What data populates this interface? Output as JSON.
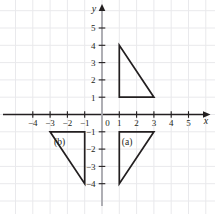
{
  "chart_data": {
    "type": "scatter",
    "title": "",
    "xlabel": "x",
    "ylabel": "y",
    "grid": true,
    "grid_spacing": 1,
    "legend": "none",
    "xlim": [
      -5,
      6
    ],
    "ylim": [
      -5,
      6
    ],
    "x_ticks": [
      -4,
      -3,
      -2,
      -1,
      0,
      1,
      2,
      3,
      4,
      5
    ],
    "y_ticks": [
      5,
      4,
      3,
      2,
      1,
      0,
      -1,
      -2,
      -3,
      -4
    ],
    "x_tick_labels": [
      "−4",
      "−3",
      "−2",
      "−1",
      "0",
      "1",
      "2",
      "3",
      "4",
      "5"
    ],
    "y_tick_labels": [
      "5",
      "4",
      "3",
      "2",
      "1",
      "0",
      "−1",
      "−2",
      "−3",
      "−4"
    ],
    "origin_label": "0",
    "series": [
      {
        "name": "original-triangle",
        "label": "",
        "type": "polygon",
        "vertices": [
          [
            1,
            4
          ],
          [
            1,
            1
          ],
          [
            3,
            1
          ]
        ],
        "color": "#231f20"
      },
      {
        "name": "triangle-a",
        "label": "(a)",
        "type": "polygon",
        "vertices": [
          [
            1,
            -1
          ],
          [
            3,
            -1
          ],
          [
            1,
            -4
          ]
        ],
        "label_position": [
          1.45,
          -1.75
        ],
        "color": "#231f20"
      },
      {
        "name": "triangle-b",
        "label": "(b)",
        "type": "polygon",
        "vertices": [
          [
            -3,
            -1
          ],
          [
            -1,
            -1
          ],
          [
            -1,
            -4
          ]
        ],
        "label_position": [
          -2.45,
          -1.75
        ],
        "color": "#231f20"
      }
    ],
    "colors": {
      "grid": "#e9e9ec",
      "axis": "#231f20",
      "y_axis_stem": "#a7a7ad",
      "shape_stroke": "#231f20",
      "text": "#231f20",
      "background": "#ffffff"
    }
  },
  "axes": {
    "x_name": "x",
    "y_name": "y"
  }
}
